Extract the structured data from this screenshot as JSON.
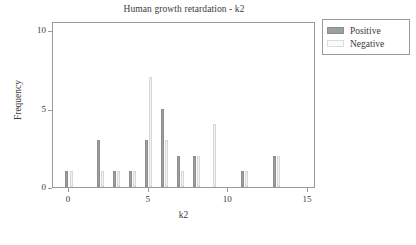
{
  "chart_data": {
    "type": "bar",
    "title": "Human growth retardation - k2",
    "xlabel": "k2",
    "ylabel": "Frequency",
    "xlim": [
      -1,
      15.5
    ],
    "ylim": [
      0,
      10.6
    ],
    "grid": false,
    "legend_position": "upper right",
    "x_ticks": [
      0,
      5,
      10,
      15
    ],
    "y_ticks": [
      0,
      5,
      10
    ],
    "categories": [
      0,
      1,
      2,
      3,
      4,
      5,
      6,
      7,
      8,
      9,
      10,
      11,
      12,
      13,
      14
    ],
    "series": [
      {
        "name": "Positive",
        "color": "#9e9e9e",
        "values": [
          1,
          0,
          3,
          1,
          1,
          3,
          5,
          2,
          2,
          0,
          0,
          1,
          0,
          2,
          0
        ]
      },
      {
        "name": "Negative",
        "color": "#f2f2f2",
        "values": [
          1,
          0,
          1,
          1,
          1,
          7,
          3,
          1,
          2,
          4,
          0,
          1,
          0,
          2,
          0
        ]
      }
    ]
  },
  "legend": {
    "entries": [
      {
        "label": "Positive",
        "swatch": "pos"
      },
      {
        "label": "Negative",
        "swatch": "neg"
      }
    ]
  }
}
